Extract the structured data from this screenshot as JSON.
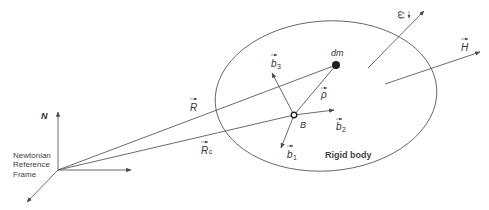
{
  "diagram": {
    "frame": {
      "label_lines": [
        "Newtonian",
        "Reference",
        "Frame"
      ],
      "axis_label": "N",
      "origin": [
        58,
        170
      ]
    },
    "body": {
      "label": "Rigid body",
      "ellipse": {
        "cx": 326,
        "cy": 96,
        "rx": 111,
        "ry": 75,
        "rotate": -4
      }
    },
    "points": {
      "dm": {
        "label": "dm",
        "pos": [
          336,
          65
        ]
      },
      "B": {
        "label": "B",
        "pos": [
          294,
          115
        ]
      }
    },
    "vectors": {
      "R": {
        "label": "R",
        "from": [
          58,
          170
        ],
        "to": [
          336,
          65
        ]
      },
      "Rc": {
        "label": "R",
        "subscript": "c",
        "from": [
          58,
          170
        ],
        "to": [
          294,
          115
        ]
      },
      "rho": {
        "label": "ρ",
        "from": [
          294,
          115
        ],
        "to": [
          336,
          65
        ]
      },
      "b1": {
        "label": "b",
        "subscript": "1",
        "from": [
          294,
          115
        ],
        "to": [
          281,
          148
        ]
      },
      "b2": {
        "label": "b",
        "subscript": "2",
        "from": [
          294,
          115
        ],
        "to": [
          334,
          110
        ]
      },
      "b3": {
        "label": "b",
        "subscript": "3",
        "from": [
          294,
          115
        ],
        "to": [
          272,
          73
        ]
      },
      "omega": {
        "label": "ω",
        "from": [
          368,
          68
        ],
        "to": [
          424,
          11
        ]
      },
      "H": {
        "label": "H",
        "from": [
          385,
          84
        ],
        "to": [
          480,
          52
        ]
      }
    },
    "colors": {
      "line": "#5a5a5a",
      "text": "#333333",
      "background": "#ffffff"
    }
  }
}
